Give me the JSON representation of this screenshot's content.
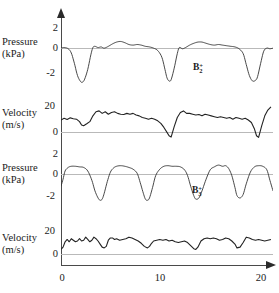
{
  "figure": {
    "width": 279,
    "height": 293,
    "background": "#ffffff",
    "trace_color": "#333333",
    "zero_line_color": "#b9b9b9",
    "axis_color": "#4a4a4a"
  },
  "axes": {
    "x": {
      "label": "",
      "ticks": [
        "0",
        "10",
        "20"
      ],
      "tick_values": [
        0,
        10,
        20
      ],
      "range": [
        0,
        20.6
      ],
      "arrow": true
    },
    "panels": [
      {
        "id": "pressure-top",
        "label_line1": "Pressure",
        "label_line2": "(kPa)",
        "unit": "kPa",
        "ticks": [
          "2",
          "0",
          "-2"
        ],
        "tick_values": [
          2,
          0,
          -2
        ],
        "range": [
          -3.4,
          2.7
        ]
      },
      {
        "id": "velocity-top",
        "label_line1": "Velocity",
        "label_line2": "(m/s)",
        "unit": "m/s",
        "ticks": [
          "20",
          "0"
        ],
        "tick_values": [
          20,
          0
        ],
        "range": [
          -3,
          26
        ]
      },
      {
        "id": "pressure-bottom",
        "label_line1": "Pressure",
        "label_line2": "(kPa)",
        "unit": "kPa",
        "ticks": [
          "2",
          "0",
          "-2"
        ],
        "tick_values": [
          2,
          0,
          -2
        ],
        "range": [
          -3.1,
          2.7
        ]
      },
      {
        "id": "velocity-bottom",
        "label_line1": "Velocity",
        "label_line2": "(m/s)",
        "unit": "m/s",
        "ticks": [
          "20",
          "0"
        ],
        "tick_values": [
          20,
          0
        ],
        "range": [
          -4,
          26
        ]
      }
    ]
  },
  "annotations": [
    {
      "id": "b2-plus",
      "base": "B",
      "sub": "2",
      "sup": "+",
      "panel": "pressure-top"
    },
    {
      "id": "b3-plus",
      "base": "B",
      "sub": "3",
      "sup": "+",
      "panel": "pressure-bottom"
    }
  ],
  "chart_data": {
    "type": "line",
    "title": "",
    "xlabel": "",
    "ylabel": "",
    "grid": false,
    "legend": false,
    "shared_x_range": [
      0,
      20.6
    ],
    "subplots": [
      {
        "name": "pressure-top",
        "ylabel": "Pressure (kPa)",
        "ylim": [
          -3.4,
          2.7
        ],
        "yticks": [
          2,
          0,
          -2
        ],
        "annotation": "B2+",
        "x": [
          0,
          0.3,
          0.7,
          1.0,
          1.3,
          1.6,
          1.9,
          2.1,
          2.3,
          2.6,
          2.9,
          3.1,
          3.3,
          3.6,
          3.9,
          4.2,
          4.6,
          5.0,
          5.4,
          5.8,
          6.2,
          6.6,
          7.0,
          7.4,
          7.8,
          8.2,
          8.6,
          9.0,
          9.4,
          9.8,
          10.1,
          10.3,
          10.5,
          10.7,
          11.0,
          11.3,
          11.5,
          11.8,
          12.1,
          12.5,
          12.9,
          13.3,
          13.7,
          14.1,
          14.5,
          14.9,
          15.3,
          15.7,
          16.1,
          16.5,
          16.9,
          17.3,
          17.7,
          18.0,
          18.3,
          18.6,
          18.9,
          19.1,
          19.4,
          19.7,
          20.0,
          20.3,
          20.6
        ],
        "y": [
          0.05,
          0.1,
          0.0,
          -0.35,
          -1.2,
          -2.2,
          -2.7,
          -2.75,
          -2.5,
          -1.7,
          -0.5,
          0.1,
          0.2,
          0.1,
          0.15,
          0.05,
          0.2,
          0.4,
          0.55,
          0.6,
          0.5,
          0.35,
          0.3,
          0.35,
          0.3,
          0.2,
          0.15,
          0.05,
          -0.15,
          -0.7,
          -1.7,
          -2.4,
          -2.65,
          -2.55,
          -1.6,
          -0.4,
          0.1,
          0.0,
          0.1,
          0.3,
          0.45,
          0.55,
          0.55,
          0.45,
          0.35,
          0.3,
          0.35,
          0.3,
          0.25,
          0.2,
          0.15,
          0.0,
          -0.4,
          -1.3,
          -2.2,
          -2.65,
          -2.6,
          -2.3,
          -1.2,
          -0.2,
          0.05,
          0.0,
          0.05
        ]
      },
      {
        "name": "velocity-top",
        "ylabel": "Velocity (m/s)",
        "ylim": [
          -3,
          26
        ],
        "yticks": [
          20,
          0
        ],
        "x": [
          0,
          0.3,
          0.6,
          0.9,
          1.2,
          1.5,
          1.8,
          2.0,
          2.2,
          2.5,
          2.8,
          3.1,
          3.4,
          3.7,
          4.0,
          4.3,
          4.6,
          4.9,
          5.2,
          5.5,
          5.8,
          6.1,
          6.4,
          6.7,
          7.0,
          7.3,
          7.6,
          7.9,
          8.2,
          8.5,
          8.8,
          9.1,
          9.4,
          9.7,
          10.0,
          10.3,
          10.5,
          10.7,
          11.0,
          11.3,
          11.6,
          11.9,
          12.2,
          12.5,
          12.8,
          13.1,
          13.4,
          13.7,
          14.0,
          14.3,
          14.6,
          14.9,
          15.2,
          15.5,
          15.8,
          16.1,
          16.4,
          16.7,
          17.0,
          17.3,
          17.6,
          17.9,
          18.2,
          18.5,
          18.8,
          19.0,
          19.2,
          19.5,
          19.8,
          20.1,
          20.4
        ],
        "y": [
          11.5,
          12.5,
          11.8,
          12.8,
          12.3,
          12.0,
          10.5,
          8.5,
          8.0,
          9.2,
          10.5,
          14.0,
          16.5,
          17.0,
          15.5,
          16.5,
          15.0,
          16.0,
          16.5,
          15.5,
          15.0,
          14.8,
          15.5,
          15.0,
          15.5,
          14.5,
          14.0,
          13.0,
          12.5,
          12.0,
          12.5,
          12.0,
          11.0,
          9.5,
          7.0,
          4.0,
          2.0,
          1.2,
          7.5,
          13.0,
          16.0,
          17.0,
          15.5,
          15.5,
          15.0,
          14.5,
          14.8,
          14.0,
          15.0,
          14.5,
          14.0,
          13.5,
          13.0,
          13.5,
          13.0,
          12.5,
          13.0,
          12.0,
          13.0,
          12.5,
          12.0,
          12.5,
          11.5,
          10.0,
          6.0,
          2.0,
          1.0,
          8.0,
          14.0,
          17.5,
          19.5
        ]
      },
      {
        "name": "pressure-bottom",
        "ylabel": "Pressure (kPa)",
        "ylim": [
          -3.1,
          2.7
        ],
        "yticks": [
          2,
          0,
          -2
        ],
        "annotation": "B3+",
        "x": [
          0,
          0.2,
          0.4,
          0.7,
          1.0,
          1.4,
          1.8,
          2.2,
          2.6,
          3.0,
          3.3,
          3.6,
          3.8,
          4.0,
          4.2,
          4.5,
          4.8,
          5.1,
          5.4,
          5.8,
          6.2,
          6.6,
          7.0,
          7.4,
          7.7,
          8.0,
          8.2,
          8.4,
          8.6,
          8.9,
          9.2,
          9.6,
          10.0,
          10.4,
          10.8,
          11.2,
          11.6,
          12.0,
          12.3,
          12.6,
          12.9,
          13.1,
          13.4,
          13.7,
          14.1,
          14.5,
          14.9,
          15.3,
          15.7,
          16.0,
          16.3,
          16.6,
          16.9,
          17.1,
          17.4,
          17.7,
          18.0,
          18.4,
          18.8,
          19.2,
          19.6,
          20.0,
          20.3,
          20.6
        ],
        "y": [
          -0.9,
          -0.3,
          0.4,
          0.7,
          0.8,
          0.8,
          0.75,
          0.7,
          0.4,
          -0.4,
          -1.3,
          -1.9,
          -2.1,
          -2.0,
          -1.5,
          -0.5,
          0.3,
          0.65,
          0.8,
          0.85,
          0.8,
          0.7,
          0.55,
          0.2,
          -0.6,
          -1.5,
          -2.0,
          -2.1,
          -1.9,
          -1.0,
          0.0,
          0.55,
          0.8,
          0.85,
          0.8,
          0.8,
          0.75,
          0.5,
          0.0,
          -0.9,
          -1.7,
          -2.0,
          -1.9,
          -1.3,
          -0.3,
          0.5,
          0.75,
          0.9,
          0.8,
          0.85,
          0.6,
          0.0,
          -1.0,
          -1.7,
          -1.9,
          -1.6,
          -0.7,
          0.3,
          0.75,
          0.85,
          0.8,
          0.5,
          -0.4,
          -1.3
        ]
      },
      {
        "name": "velocity-bottom",
        "ylabel": "Velocity (m/s)",
        "ylim": [
          -4,
          26
        ],
        "yticks": [
          20,
          0
        ],
        "x": [
          0,
          0.2,
          0.4,
          0.6,
          0.8,
          1.0,
          1.2,
          1.4,
          1.6,
          1.8,
          2.0,
          2.2,
          2.4,
          2.6,
          2.8,
          3.0,
          3.2,
          3.4,
          3.6,
          3.8,
          4.0,
          4.2,
          4.4,
          4.6,
          4.8,
          5.0,
          5.2,
          5.4,
          5.7,
          6.0,
          6.3,
          6.6,
          6.9,
          7.2,
          7.5,
          7.8,
          8.1,
          8.4,
          8.6,
          8.8,
          9.0,
          9.3,
          9.6,
          9.9,
          10.2,
          10.5,
          10.8,
          11.1,
          11.4,
          11.7,
          12.0,
          12.3,
          12.6,
          12.9,
          13.1,
          13.3,
          13.6,
          13.9,
          14.2,
          14.5,
          14.8,
          15.1,
          15.4,
          15.7,
          16.0,
          16.3,
          16.6,
          16.9,
          17.1,
          17.4,
          17.7,
          18.0,
          18.3,
          18.6,
          18.9,
          19.2,
          19.5,
          19.8,
          20.1,
          20.4
        ],
        "y": [
          5.5,
          7.0,
          10.5,
          12.0,
          10.5,
          12.5,
          11.5,
          10.5,
          11.0,
          12.5,
          11.0,
          11.5,
          13.5,
          12.0,
          10.5,
          11.5,
          13.5,
          12.5,
          11.0,
          9.0,
          7.0,
          6.5,
          7.5,
          11.5,
          13.0,
          13.0,
          12.0,
          12.5,
          11.5,
          12.0,
          12.5,
          13.5,
          13.0,
          12.0,
          11.0,
          9.5,
          7.5,
          6.5,
          7.5,
          9.5,
          11.0,
          11.5,
          12.0,
          11.5,
          12.0,
          11.0,
          11.5,
          10.5,
          10.0,
          10.5,
          11.0,
          10.0,
          8.0,
          6.0,
          5.5,
          7.0,
          11.0,
          12.5,
          13.0,
          12.5,
          13.0,
          12.5,
          11.5,
          12.0,
          13.0,
          12.5,
          11.0,
          9.0,
          6.5,
          7.0,
          10.0,
          13.5,
          13.0,
          12.0,
          11.5,
          12.0,
          11.5,
          11.0,
          11.5,
          12.0
        ]
      }
    ]
  }
}
